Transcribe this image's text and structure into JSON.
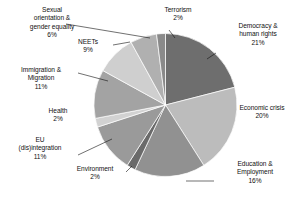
{
  "chart_data": {
    "type": "pie",
    "title": "",
    "subtitle": "",
    "xlabel": "",
    "ylabel": "",
    "legend_position": "none",
    "grid": false,
    "units": "percent",
    "total": 100,
    "start_angle_deg": 0,
    "direction": "clockwise",
    "categories": [
      "Democracy & human rights",
      "Economic crisis",
      "Education & Employment",
      "Environment",
      "EU (dis)integration",
      "Health",
      "Immigration & Migration",
      "NEETs",
      "Sexual orientation & gender equality",
      "Terrorism"
    ],
    "values": [
      21,
      20,
      16,
      2,
      11,
      2,
      11,
      9,
      6,
      2
    ],
    "slices": [
      {
        "name": "Democracy & human rights",
        "label_line1": "Democracy &",
        "label_line2": "human rights",
        "value": 21,
        "pct_text": "21%",
        "color": "#6e6e6e"
      },
      {
        "name": "Economic crisis",
        "label_line1": "Economic crisis",
        "label_line2": "",
        "value": 20,
        "pct_text": "20%",
        "color": "#bcbcbc"
      },
      {
        "name": "Education & Employment",
        "label_line1": "Education &",
        "label_line2": "Employment",
        "value": 16,
        "pct_text": "16%",
        "color": "#919191"
      },
      {
        "name": "Environment",
        "label_line1": "Environment",
        "label_line2": "",
        "value": 2,
        "pct_text": "2%",
        "color": "#6a6a6a"
      },
      {
        "name": "EU (dis)integration",
        "label_line1": "EU",
        "label_line2": "(dis)integration",
        "value": 11,
        "pct_text": "11%",
        "color": "#9a9a9a"
      },
      {
        "name": "Health",
        "label_line1": "Health",
        "label_line2": "",
        "value": 2,
        "pct_text": "2%",
        "color": "#d2d2d2"
      },
      {
        "name": "Immigration & Migration",
        "label_line1": "Immigration &",
        "label_line2": "Migration",
        "value": 11,
        "pct_text": "11%",
        "color": "#a3a3a3"
      },
      {
        "name": "NEETs",
        "label_line1": "NEETs",
        "label_line2": "",
        "value": 9,
        "pct_text": "9%",
        "color": "#cfcfcf"
      },
      {
        "name": "Sexual orientation & gender equality",
        "label_line1": "Sexual",
        "label_line2": "orientation &",
        "label_line3": "gender equality",
        "value": 6,
        "pct_text": "6%",
        "color": "#b0b0b0"
      },
      {
        "name": "Terrorism",
        "label_line1": "Terrorism",
        "label_line2": "",
        "value": 2,
        "pct_text": "2%",
        "color": "#8a8a8a"
      }
    ]
  },
  "labels": {
    "terrorism": {
      "l1": "Terrorism",
      "pct": "2%"
    },
    "democracy": {
      "l1": "Democracy &",
      "l2": "human rights",
      "pct": "21%"
    },
    "economic": {
      "l1": "Economic crisis",
      "pct": "20%"
    },
    "education": {
      "l1": "Education &",
      "l2": "Employment",
      "pct": "16%"
    },
    "environment": {
      "l1": "Environment",
      "pct": "2%"
    },
    "eu": {
      "l1": "EU",
      "l2": "(dis)integration",
      "pct": "11%"
    },
    "health": {
      "l1": "Health",
      "pct": "2%"
    },
    "immigration": {
      "l1": "Immigration &",
      "l2": "Migration",
      "pct": "11%"
    },
    "neets": {
      "l1": "NEETs",
      "pct": "9%"
    },
    "sexual": {
      "l1": "Sexual",
      "l2": "orientation &",
      "l3": "gender equality",
      "pct": "6%"
    }
  }
}
